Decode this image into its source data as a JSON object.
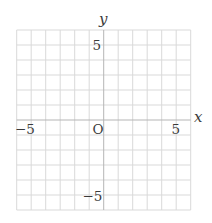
{
  "chart_data": {
    "type": "scatter",
    "title": "",
    "subtitle": "",
    "xlabel": "x",
    "ylabel": "y",
    "xlim": [
      -6,
      6
    ],
    "ylim": [
      -6,
      6
    ],
    "grid": true,
    "grid_step": 1,
    "legend": null,
    "origin_label": "O",
    "x_tick_labels": [
      {
        "value": -5,
        "label": "−5"
      },
      {
        "value": 5,
        "label": "5"
      }
    ],
    "y_tick_labels": [
      {
        "value": 5,
        "label": "5"
      },
      {
        "value": -5,
        "label": "−5"
      }
    ],
    "series": [],
    "colors": {
      "grid": "#d9d9d9",
      "axis": "#b5b5b5",
      "text": "#3a3a3a"
    }
  },
  "labels": {
    "x_axis": "x",
    "y_axis": "y",
    "origin": "O",
    "x_neg5": "−5",
    "x_pos5": "5",
    "y_pos5": "5",
    "y_neg5": "−5"
  }
}
